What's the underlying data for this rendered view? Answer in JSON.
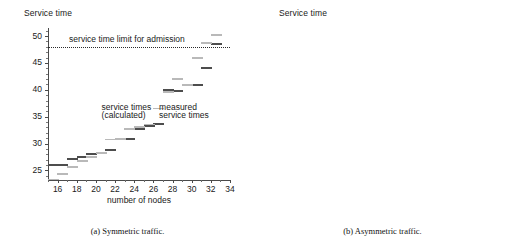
{
  "figure": {
    "panels": [
      {
        "id": "panel-a",
        "caption": "(a) Symmetric traffic.",
        "ylabel": "Service time",
        "xlabel": "number of nodes",
        "limit_label": "service time limit for admission",
        "annotation_calculated_line1": "service times",
        "annotation_calculated_line2": "(calculated)",
        "annotation_measured_line1": "measured",
        "annotation_measured_line2": "service times"
      },
      {
        "id": "panel-b",
        "caption": "(b) Asymmetric traffic.",
        "ylabel": "Service time",
        "xlabel": "number of nodes",
        "limit_label": "service time limit for admission",
        "annotation_calculated_line1": "service times",
        "annotation_calculated_line2": "(calculated)",
        "annotation_measured_line1": "measured",
        "annotation_measured_line2": "service times"
      }
    ]
  },
  "chart_data": [
    {
      "type": "scatter",
      "id": "symmetric-traffic",
      "title": "Service time",
      "subtitle": "(a) Symmetric traffic.",
      "xlabel": "number of nodes",
      "ylabel": "Service time",
      "xlim": [
        15,
        34
      ],
      "ylim": [
        23.2,
        51.5
      ],
      "xticks": [
        16,
        18,
        20,
        22,
        24,
        26,
        28,
        30,
        32,
        34
      ],
      "yticks": [
        25,
        30,
        35,
        40,
        45,
        50
      ],
      "xtick_labels": [
        "16",
        "18",
        "20",
        "22",
        "24",
        "26",
        "28",
        "30",
        "32",
        "34"
      ],
      "ytick_labels": [
        "25",
        "30",
        "35",
        "40",
        "45",
        "50"
      ],
      "grid": false,
      "legend": "inline-annotations",
      "annotations": [
        {
          "text": "service time limit for admission",
          "x": 17.2,
          "y": 49.3
        },
        {
          "text": "service times",
          "x": 20.6,
          "y": 36.7
        },
        {
          "text": "(calculated)",
          "x": 20.6,
          "y": 35.2
        },
        {
          "text": "measured",
          "x": 26.6,
          "y": 36.7
        },
        {
          "text": "service times",
          "x": 26.6,
          "y": 35.2
        }
      ],
      "hlines": [
        {
          "label": "service time limit for admission",
          "y": 48.0,
          "style": "dotted"
        }
      ],
      "series": [
        {
          "name": "measured service times",
          "color": "#4d4d4d",
          "x": [
            15.5,
            16.5,
            17.5,
            18.5,
            19.5,
            20.5,
            21.5,
            22.5,
            23.5,
            24.5,
            25.5,
            26.5,
            27.5,
            28.5,
            29.5,
            30.5,
            31.5,
            32.5
          ],
          "values": [
            26.2,
            26.2,
            27.3,
            27.6,
            28.2,
            28.4,
            29.0,
            31.0,
            31.0,
            32.9,
            33.4,
            33.8,
            40.1,
            40.0,
            41.0,
            41.0,
            44.2,
            48.7
          ]
        },
        {
          "name": "service times (calculated)",
          "color": "#b9b9b9",
          "x": [
            15.5,
            16.5,
            17.5,
            18.5,
            19.5,
            20.5,
            21.5,
            22.5,
            23.5,
            24.5,
            25.5,
            26.5,
            27.5,
            28.5,
            29.5,
            30.5,
            31.5,
            32.5
          ],
          "values": [
            23.4,
            24.5,
            25.8,
            26.9,
            27.6,
            28.4,
            30.9,
            31.0,
            32.8,
            33.2,
            33.7,
            36.7,
            39.7,
            42.2,
            41.0,
            46.1,
            48.9,
            50.3
          ]
        }
      ]
    },
    {
      "type": "scatter",
      "id": "asymmetric-traffic",
      "title": "Service time",
      "subtitle": "(b) Asymmetric traffic.",
      "xlabel": "number of nodes",
      "ylabel": "Service time",
      "xlim": [
        15,
        34
      ],
      "ylim": [
        23.2,
        49.5
      ],
      "xticks": [
        16,
        18,
        20,
        22,
        24,
        26,
        28,
        30,
        32,
        34
      ],
      "yticks": [
        25,
        30,
        35,
        40,
        45
      ],
      "xtick_labels": [
        "16",
        "18",
        "20",
        "22",
        "24",
        "26",
        "28",
        "30",
        "32",
        "34"
      ],
      "ytick_labels": [
        "25",
        "30",
        "35",
        "40",
        "45"
      ],
      "grid": false,
      "legend": "inline-annotations",
      "annotations": [
        {
          "text": "service time limit for admission",
          "x": 17.0,
          "y": 46.2
        },
        {
          "text": "service times",
          "x": 20.4,
          "y": 38.2
        },
        {
          "text": "(calculated)",
          "x": 20.4,
          "y": 36.6
        },
        {
          "text": "measured",
          "x": 25.7,
          "y": 31.6
        },
        {
          "text": "service times",
          "x": 25.3,
          "y": 30.1
        }
      ],
      "hlines": [
        {
          "label": "service time limit for admission",
          "y": 47.6,
          "style": "dotted"
        }
      ],
      "series": [
        {
          "name": "measured service times",
          "color": "#4d4d4d",
          "x": [
            15.5,
            16.5,
            17.5,
            18.5,
            19.5,
            20.5,
            21.5,
            22.5,
            23.5,
            24.5,
            25.5,
            26.5,
            27.5,
            28.5,
            29.5,
            30.5,
            31.5
          ],
          "values": [
            25.9,
            26.7,
            26.9,
            29.2,
            29.8,
            29.2,
            32.6,
            31.7,
            32.7,
            32.8,
            33.4,
            38.4,
            40.3,
            40.1,
            41.5,
            42.5,
            47.7
          ]
        },
        {
          "name": "service times (calculated)",
          "color": "#b9b9b9",
          "x": [
            15.5,
            16.5,
            17.5,
            18.5,
            19.5,
            20.5,
            21.5,
            22.5,
            23.5,
            24.5,
            25.5,
            26.5,
            27.5,
            28.5,
            29.5,
            30.5,
            31.5
          ],
          "values": [
            23.4,
            24.9,
            26.6,
            28.0,
            29.0,
            29.9,
            31.4,
            32.2,
            33.8,
            35.5,
            37.6,
            39.6,
            41.8,
            45.1,
            44.2,
            46.0,
            48.6
          ]
        }
      ]
    }
  ]
}
